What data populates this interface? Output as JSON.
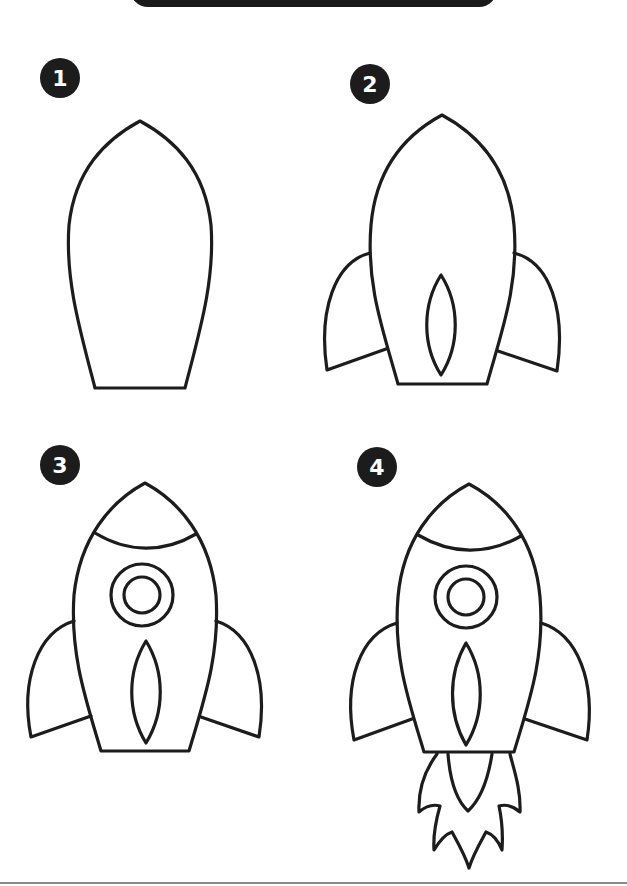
{
  "header": {
    "title": ""
  },
  "steps": [
    {
      "number": "1",
      "label": "Step 1: rocket body outline"
    },
    {
      "number": "2",
      "label": "Step 2: add fins and center window"
    },
    {
      "number": "3",
      "label": "Step 3: add nose band and porthole"
    },
    {
      "number": "4",
      "label": "Step 4: add exhaust flame"
    }
  ],
  "colors": {
    "ink": "#1c1c1c",
    "paper": "#ffffff",
    "rule": "#8a8a8a"
  }
}
